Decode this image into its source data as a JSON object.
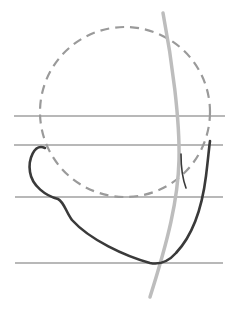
{
  "figure": {
    "colors": {
      "background": "#ffffff",
      "guide_line": "#b8b8b8",
      "dashed_circle": "#9a9a9a",
      "center_curve": "#bdbdbd",
      "contour": "#3a3a3a"
    },
    "guide_lines_y": [
      116,
      145,
      197,
      263
    ]
  }
}
